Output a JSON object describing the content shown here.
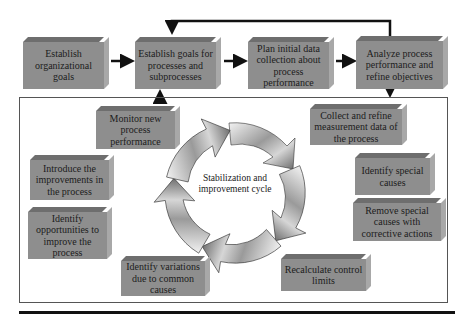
{
  "diagram": {
    "top_row": [
      {
        "id": "establish-org-goals",
        "label": "Establish organizational goals"
      },
      {
        "id": "establish-process-goals",
        "label": "Establish goals for processes and subprocesses"
      },
      {
        "id": "plan-data-collection",
        "label": "Plan initial data collection about process performance"
      },
      {
        "id": "analyze-performance",
        "label": "Analyze process performance and refine objectives"
      }
    ],
    "cycle": {
      "center_label": "Stabilization and improvement cycle",
      "steps": [
        {
          "id": "collect-data",
          "label": "Collect and refine measurement data of the process"
        },
        {
          "id": "identify-special",
          "label": "Identify special causes"
        },
        {
          "id": "remove-special",
          "label": "Remove special causes with corrective actions"
        },
        {
          "id": "recalculate-limits",
          "label": "Recalculate control limits"
        },
        {
          "id": "identify-variations",
          "label": "Identify variations due to common causes"
        },
        {
          "id": "identify-opportunities",
          "label": "Identify opportunities to improve the process"
        },
        {
          "id": "introduce-improvements",
          "label": "Introduce the improvements in the process"
        },
        {
          "id": "monitor-performance",
          "label": "Monitor new process performance"
        }
      ]
    },
    "colors": {
      "box_face": "#8e8e8e",
      "box_top": "#6e6e6e",
      "box_side": "#a8a8a8",
      "arrow": "#111111",
      "frame": "#555555"
    }
  }
}
